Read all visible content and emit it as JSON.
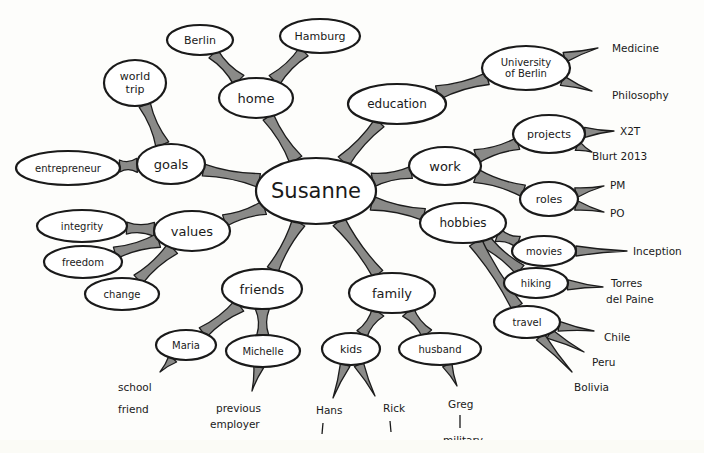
{
  "diagram": {
    "title": "Susanne",
    "colors": {
      "background": "#fdfdfb",
      "branch": "#8a8a88",
      "stroke": "#1a1a1a",
      "node_fill": "#ffffff"
    },
    "nodes": [
      {
        "id": "susanne",
        "label": "Susanne",
        "cx": 316,
        "cy": 191,
        "rx": 60,
        "ry": 33,
        "size": 21
      },
      {
        "id": "home",
        "label": "home",
        "cx": 256,
        "cy": 98,
        "rx": 37,
        "ry": 20,
        "size": 13
      },
      {
        "id": "berlin",
        "label": "Berlin",
        "cx": 200,
        "cy": 40,
        "rx": 33,
        "ry": 15,
        "size": 11
      },
      {
        "id": "hamburg",
        "label": "Hamburg",
        "cx": 320,
        "cy": 36,
        "rx": 40,
        "ry": 17,
        "size": 11
      },
      {
        "id": "education",
        "label": "education",
        "cx": 397,
        "cy": 104,
        "rx": 49,
        "ry": 20,
        "size": 12
      },
      {
        "id": "uni",
        "label": "University of Berlin",
        "cx": 526,
        "cy": 68,
        "rx": 44,
        "ry": 22,
        "size": 10
      },
      {
        "id": "goals",
        "label": "goals",
        "cx": 171,
        "cy": 164,
        "rx": 34,
        "ry": 20,
        "size": 13
      },
      {
        "id": "worldtrip",
        "label": "world trip",
        "cx": 135,
        "cy": 83,
        "rx": 31,
        "ry": 23,
        "size": 11
      },
      {
        "id": "entre",
        "label": "entrepreneur",
        "cx": 68,
        "cy": 168,
        "rx": 52,
        "ry": 17,
        "size": 10
      },
      {
        "id": "work",
        "label": "work",
        "cx": 445,
        "cy": 166,
        "rx": 36,
        "ry": 19,
        "size": 13
      },
      {
        "id": "projects",
        "label": "projects",
        "cx": 549,
        "cy": 134,
        "rx": 36,
        "ry": 19,
        "size": 11
      },
      {
        "id": "roles",
        "label": "roles",
        "cx": 549,
        "cy": 199,
        "rx": 29,
        "ry": 17,
        "size": 11
      },
      {
        "id": "values",
        "label": "values",
        "cx": 192,
        "cy": 231,
        "rx": 38,
        "ry": 20,
        "size": 13
      },
      {
        "id": "integrity",
        "label": "integrity",
        "cx": 82,
        "cy": 226,
        "rx": 45,
        "ry": 16,
        "size": 10
      },
      {
        "id": "freedom",
        "label": "freedom",
        "cx": 83,
        "cy": 262,
        "rx": 39,
        "ry": 16,
        "size": 10
      },
      {
        "id": "change",
        "label": "change",
        "cx": 122,
        "cy": 294,
        "rx": 37,
        "ry": 16,
        "size": 10
      },
      {
        "id": "hobbies",
        "label": "hobbies",
        "cx": 463,
        "cy": 223,
        "rx": 43,
        "ry": 20,
        "size": 12
      },
      {
        "id": "movies",
        "label": "movies",
        "cx": 544,
        "cy": 251,
        "rx": 32,
        "ry": 15,
        "size": 10
      },
      {
        "id": "hiking",
        "label": "hiking",
        "cx": 536,
        "cy": 283,
        "rx": 32,
        "ry": 15,
        "size": 10
      },
      {
        "id": "travel",
        "label": "travel",
        "cx": 527,
        "cy": 322,
        "rx": 33,
        "ry": 16,
        "size": 10
      },
      {
        "id": "friends",
        "label": "friends",
        "cx": 262,
        "cy": 289,
        "rx": 40,
        "ry": 20,
        "size": 13
      },
      {
        "id": "maria",
        "label": "Maria",
        "cx": 186,
        "cy": 345,
        "rx": 30,
        "ry": 15,
        "size": 10
      },
      {
        "id": "michelle",
        "label": "Michelle",
        "cx": 263,
        "cy": 351,
        "rx": 37,
        "ry": 16,
        "size": 10
      },
      {
        "id": "family",
        "label": "family",
        "cx": 392,
        "cy": 293,
        "rx": 43,
        "ry": 20,
        "size": 13
      },
      {
        "id": "kids",
        "label": "kids",
        "cx": 351,
        "cy": 349,
        "rx": 29,
        "ry": 16,
        "size": 11
      },
      {
        "id": "husband",
        "label": "husband",
        "cx": 440,
        "cy": 349,
        "rx": 41,
        "ry": 16,
        "size": 10
      }
    ],
    "branches": [
      [
        "susanne",
        "home"
      ],
      [
        "home",
        "berlin"
      ],
      [
        "home",
        "hamburg"
      ],
      [
        "susanne",
        "education"
      ],
      [
        "education",
        "uni"
      ],
      [
        "susanne",
        "goals"
      ],
      [
        "goals",
        "worldtrip"
      ],
      [
        "goals",
        "entre"
      ],
      [
        "susanne",
        "work"
      ],
      [
        "work",
        "projects"
      ],
      [
        "work",
        "roles"
      ],
      [
        "susanne",
        "values"
      ],
      [
        "values",
        "integrity"
      ],
      [
        "values",
        "freedom"
      ],
      [
        "values",
        "change"
      ],
      [
        "susanne",
        "hobbies"
      ],
      [
        "hobbies",
        "movies"
      ],
      [
        "hobbies",
        "hiking"
      ],
      [
        "hobbies",
        "travel"
      ],
      [
        "susanne",
        "friends"
      ],
      [
        "friends",
        "maria"
      ],
      [
        "friends",
        "michelle"
      ],
      [
        "susanne",
        "family"
      ],
      [
        "family",
        "kids"
      ],
      [
        "family",
        "husband"
      ]
    ],
    "leaves": [
      {
        "from": "uni",
        "label": "Medicine",
        "x": 612,
        "y": 48,
        "tx": 598,
        "ty": 48
      },
      {
        "from": "uni",
        "label": "Philosophy",
        "x": 612,
        "y": 95,
        "tx": 592,
        "ty": 91
      },
      {
        "from": "projects",
        "label": "X2T",
        "x": 620,
        "y": 131,
        "tx": 614,
        "ty": 131
      },
      {
        "from": "projects",
        "label": "Blurt 2013",
        "x": 592,
        "y": 156,
        "tx": 592,
        "ty": 152
      },
      {
        "from": "roles",
        "label": "PM",
        "x": 610,
        "y": 185,
        "tx": 604,
        "ty": 186
      },
      {
        "from": "roles",
        "label": "PO",
        "x": 610,
        "y": 213,
        "tx": 604,
        "ty": 212
      },
      {
        "from": "movies",
        "label": "Inception",
        "x": 633,
        "y": 251,
        "tx": 627,
        "ty": 251
      },
      {
        "from": "hiking",
        "label": "Torres",
        "x": 611,
        "y": 283,
        "tx": 603,
        "ty": 287
      },
      {
        "from": "hiking",
        "label": "del Paine",
        "x": 606,
        "y": 299,
        "tx": null,
        "ty": null
      },
      {
        "from": "travel",
        "label": "Chile",
        "x": 604,
        "y": 337,
        "tx": 594,
        "ty": 331
      },
      {
        "from": "travel",
        "label": "Peru",
        "x": 592,
        "y": 362,
        "tx": 584,
        "ty": 352
      },
      {
        "from": "travel",
        "label": "Bolivia",
        "x": 574,
        "y": 387,
        "tx": 572,
        "ty": 372
      },
      {
        "from": "maria",
        "label": "school",
        "x": 118,
        "y": 387,
        "tx": 160,
        "ty": 372
      },
      {
        "from": "maria",
        "label": "friend",
        "x": 118,
        "y": 409,
        "tx": null,
        "ty": null
      },
      {
        "from": "michelle",
        "label": "previous",
        "x": 216,
        "y": 408,
        "tx": 252,
        "ty": 391
      },
      {
        "from": "michelle",
        "label": "employer",
        "x": 210,
        "y": 424,
        "tx": null,
        "ty": null
      },
      {
        "from": "kids",
        "label": "Hans",
        "x": 316,
        "y": 410,
        "tx": 333,
        "ty": 398
      },
      {
        "from": "kids",
        "label": "Rick",
        "x": 383,
        "y": 408,
        "tx": 375,
        "ty": 396
      },
      {
        "from": "husband",
        "label": "Greg",
        "x": 448,
        "y": 404,
        "tx": 457,
        "ty": 386
      },
      {
        "from": "husband",
        "label": "military",
        "x": 443,
        "y": 440,
        "tx": null,
        "ty": null
      }
    ],
    "ticks": [
      {
        "x1": 323,
        "y1": 423,
        "x2": 322,
        "y2": 434
      },
      {
        "x1": 390,
        "y1": 421,
        "x2": 391,
        "y2": 432
      },
      {
        "x1": 460,
        "y1": 415,
        "x2": 460,
        "y2": 428
      },
      {
        "x1": 392,
        "y1": 442,
        "x2": 396,
        "y2": 442
      }
    ]
  }
}
